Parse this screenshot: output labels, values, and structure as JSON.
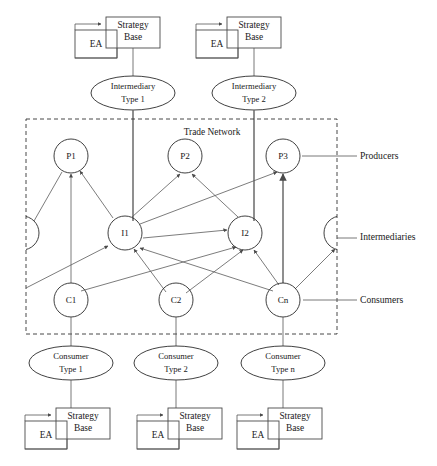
{
  "diagram": {
    "network_label": "Trade Network",
    "side_labels": {
      "producers": "Producers",
      "intermediaries": "Intermediaries",
      "consumers": "Consumers"
    },
    "agent_box_labels": {
      "ea": "EA",
      "strategy_line1": "Strategy",
      "strategy_line2": "Base"
    },
    "intermediary_types": [
      {
        "line1": "Intermediary",
        "line2": "Type 1"
      },
      {
        "line1": "Intermediary",
        "line2": "Type 2"
      }
    ],
    "consumer_types": [
      {
        "line1": "Consumer",
        "line2": "Type 1"
      },
      {
        "line1": "Consumer",
        "line2": "Type 2"
      },
      {
        "line1": "Consumer",
        "line2": "Type n"
      }
    ],
    "producers": [
      {
        "id": "P1",
        "label": "P1",
        "cx": 71,
        "cy": 156
      },
      {
        "id": "P2",
        "label": "P2",
        "cx": 185,
        "cy": 156
      },
      {
        "id": "P3",
        "label": "P3",
        "cx": 283,
        "cy": 156
      }
    ],
    "intermediaries": [
      {
        "id": "I1",
        "label": "I1",
        "cx": 125,
        "cy": 233
      },
      {
        "id": "I2",
        "label": "I2",
        "cx": 245,
        "cy": 233
      }
    ],
    "consumers": [
      {
        "id": "C1",
        "label": "C1",
        "cx": 71,
        "cy": 300
      },
      {
        "id": "C2",
        "label": "C2",
        "cx": 176,
        "cy": 300
      },
      {
        "id": "Cn",
        "label": "Cn",
        "cx": 283,
        "cy": 300
      }
    ],
    "colors": {
      "stroke": "#2b2b2b",
      "edge": "#5a5a5a",
      "frame": "#333333",
      "text": "#1a1a1a",
      "background": "#ffffff"
    },
    "frame": {
      "x": 26,
      "y": 119,
      "width": 311,
      "height": 215
    }
  }
}
